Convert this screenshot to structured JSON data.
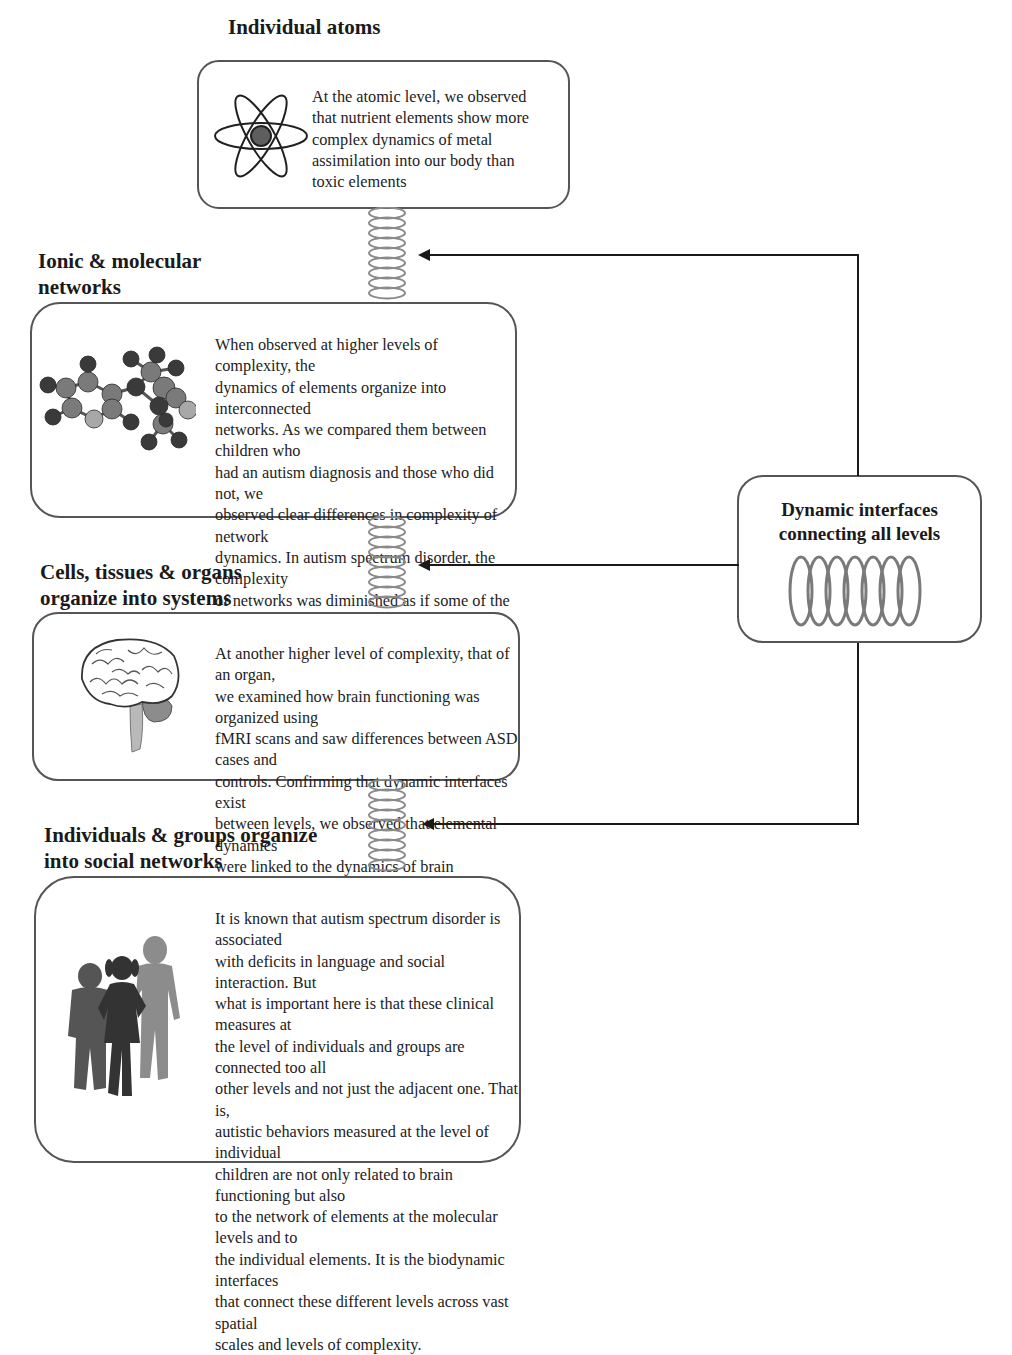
{
  "levels": [
    {
      "heading": "Individual atoms",
      "heading_lines": [
        "Individual atoms"
      ],
      "icon": "atom-icon",
      "text": "At the atomic level, we observed that nutrient elements show more complex dynamics of metal assimilation into our body than toxic elements",
      "text_lines": [
        "At the atomic level, we observed",
        "that nutrient elements show more",
        "complex dynamics of metal",
        "assimilation into our body than",
        "toxic elements"
      ]
    },
    {
      "heading": "Ionic & molecular networks",
      "heading_lines": [
        "Ionic & molecular",
        "networks"
      ],
      "icon": "molecule-icon",
      "text": "When observed at higher levels of complexity, the dynamics of elements organize into interconnected networks. As we compared them between children who had an autism diagnosis and those who did not, we observed clear differences in complexity of network dynamics. In autism spectrum disorder, the complexity of networks was diminished as if some of the links in the networks were broken",
      "text_lines": [
        "When observed at higher levels of complexity, the",
        "dynamics of elements organize into interconnected",
        "networks. As we compared them between children who",
        "had an autism diagnosis and those who did not, we",
        "observed clear differences in complexity of network",
        "dynamics. In autism spectrum disorder, the complexity",
        "of networks was diminished as if some of the links in the",
        "networks were broken"
      ]
    },
    {
      "heading": "Cells, tissues & organs organize into systems",
      "heading_lines": [
        "Cells, tissues & organs",
        "organize into systems"
      ],
      "icon": "brain-icon",
      "text": "At another higher level of complexity, that of an organ, we examined how brain functioning was organized using fMRI scans and saw differences between ASD cases and controls. Confirming that dynamic interfaces exist between levels, we observed that elemental dynamics were linked to the dynamics of brain functioning",
      "text_lines": [
        "At another higher level of complexity, that of an organ,",
        "we examined how brain functioning was organized using",
        "fMRI scans and saw differences between ASD cases and",
        "controls. Confirming that dynamic interfaces exist",
        "between levels, we observed that elemental dynamics",
        "were linked to the dynamics of brain functioning"
      ]
    },
    {
      "heading": "Individuals & groups organize into social networks",
      "heading_lines": [
        "Individuals & groups organize",
        "into social networks"
      ],
      "icon": "children-group-icon",
      "text": "It is known that autism spectrum disorder is associated with deficits in language and social interaction. But what is important here is that these clinical measures at the level of individuals and groups are connected too all other levels and not just the adjacent one. That is, autistic behaviors measured at the level of individual children are not only related to brain functioning but also to the network of elements at the molecular levels and to the individual elements. It is the biodynamic interfaces that connect these different levels across vast spatial scales and levels of complexity.",
      "text_lines": [
        "It is known that autism spectrum disorder is associated",
        "with deficits in language and social interaction. But",
        "what is important here is that these clinical measures at",
        "the level of individuals and groups are connected too all",
        "other levels and not just the adjacent one. That is,",
        "autistic behaviors measured at the level of individual",
        "children are not only related to brain functioning but also",
        "to the network of elements at the molecular levels and to",
        "the individual elements. It is the biodynamic interfaces",
        "that connect these different levels across vast spatial",
        "scales and levels of complexity."
      ]
    }
  ],
  "side_box": {
    "title": "Dynamic interfaces connecting all levels",
    "title_lines": [
      "Dynamic interfaces",
      "connecting all levels"
    ],
    "icon": "helix-spring-icon"
  },
  "connectors": {
    "arrow_targets": [
      "Ionic & molecular networks",
      "Cells, tissues & organs organize into systems",
      "Individuals & groups organize into social networks"
    ],
    "spring_color": "#8a8a8a",
    "line_color": "#1a1a1a"
  },
  "colors": {
    "box_border": "#555555",
    "text": "#222222",
    "molecule_dark": "#3a3a3a",
    "molecule_mid": "#7a7a7a",
    "molecule_light": "#a8a8a8",
    "children": [
      "#555555",
      "#333333",
      "#8c8c8c"
    ]
  }
}
